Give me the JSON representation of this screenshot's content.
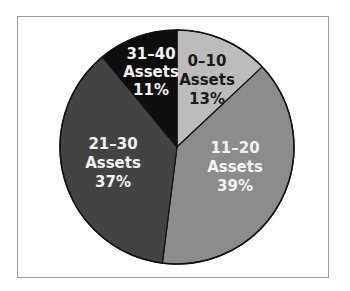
{
  "chart_data": {
    "type": "pie",
    "title": "",
    "categories": [
      "0–10 Assets",
      "11–20 Assets",
      "21–30 Assets",
      "31–40 Assets"
    ],
    "values": [
      13,
      39,
      37,
      11
    ],
    "unit": "%",
    "start_angle_deg": 0,
    "direction": "clockwise",
    "legend": "none (labels inside slices)",
    "slices": [
      {
        "range": "0–10",
        "word": "Assets",
        "pct": "13%",
        "value": 13,
        "color": "#bcbcbc",
        "text_color": "#1a1a1a"
      },
      {
        "range": "11–20",
        "word": "Assets",
        "pct": "39%",
        "value": 39,
        "color": "#8c8c8c",
        "text_color": "#f2f2f2"
      },
      {
        "range": "21–30",
        "word": "Assets",
        "pct": "37%",
        "value": 37,
        "color": "#434343",
        "text_color": "#f2f2f2"
      },
      {
        "range": "31–40",
        "word": "Assets",
        "pct": "11%",
        "value": 11,
        "color": "#0e0e0e",
        "text_color": "#f2f2f2"
      }
    ]
  }
}
